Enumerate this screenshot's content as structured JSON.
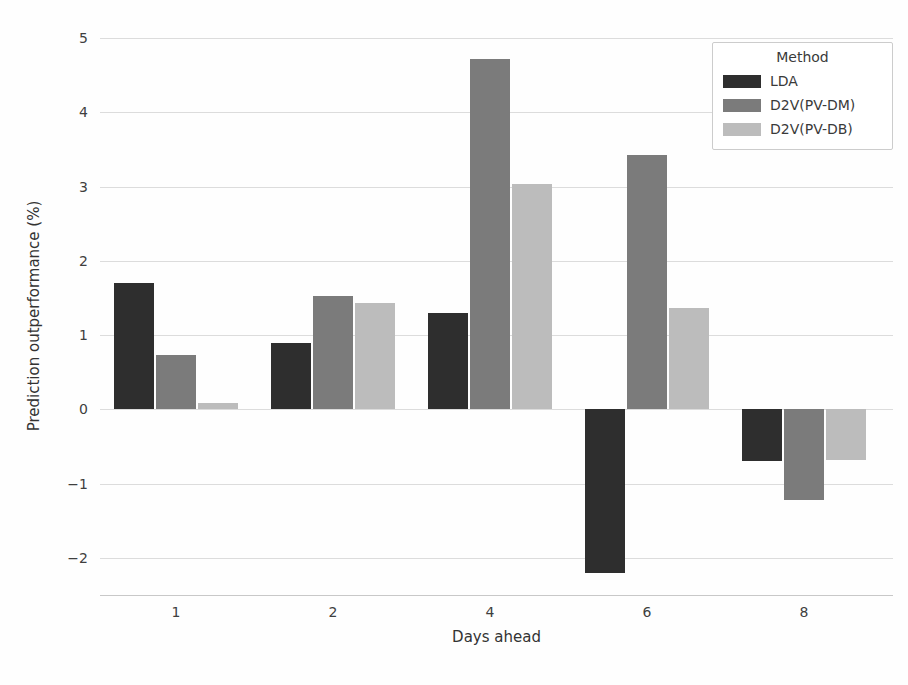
{
  "chart_data": {
    "type": "bar",
    "title": "",
    "xlabel": "Days ahead",
    "ylabel": "Prediction outperformance (%)",
    "categories": [
      "1",
      "2",
      "4",
      "6",
      "8"
    ],
    "series": [
      {
        "name": "LDA",
        "color": "#2e2e2e",
        "values": [
          1.7,
          0.9,
          1.3,
          -2.2,
          -0.7
        ]
      },
      {
        "name": "D2V(PV-DM)",
        "color": "#7b7b7b",
        "values": [
          0.73,
          1.52,
          4.72,
          3.42,
          -1.22
        ]
      },
      {
        "name": "D2V(PV-DB)",
        "color": "#bcbcbc",
        "values": [
          0.08,
          1.43,
          3.03,
          1.36,
          -0.68
        ]
      }
    ],
    "ylim": [
      -2.5,
      5
    ],
    "yticks": [
      5,
      4,
      3,
      2,
      1,
      0,
      -1,
      -2
    ],
    "ytick_labels": [
      "5",
      "4",
      "3",
      "2",
      "1",
      "0",
      "−1",
      "−2"
    ],
    "grid": true,
    "legend": {
      "title": "Method",
      "position": "upper right"
    }
  },
  "colors": {
    "grid": "#dcdcdc",
    "axis_line": "#c8c8c8",
    "text": "#3d3d3d",
    "legend_border": "#cccccc",
    "background": "#fefefe"
  }
}
